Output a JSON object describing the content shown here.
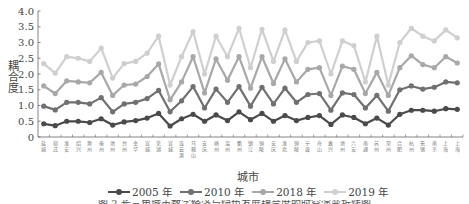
{
  "chart_data": {
    "type": "line",
    "title": "",
    "xlabel": "城市",
    "ylabel": "耦合度",
    "ylim": [
      0,
      4.0
    ],
    "yticks": [
      "0",
      "0.5",
      "1.0",
      "1.5",
      "2.0",
      "2.5",
      "3.0",
      "3.5",
      "4.0"
    ],
    "grid": false,
    "legend_position": "bottom",
    "categories": [
      "盐城",
      "宿迁",
      "淮安",
      "绍兴",
      "滁州",
      "泰州",
      "池州",
      "台州",
      "金华",
      "宣城",
      "芜湖",
      "宣城",
      "连云港",
      "马鞍山",
      "安庆",
      "扬州",
      "温州",
      "衢州",
      "镇江",
      "铜陵",
      "安庆",
      "淮北",
      "铜陵",
      "宁波",
      "舟山",
      "嘉兴",
      "池州",
      "六安",
      "南通",
      "苏州",
      "常州",
      "合肥",
      "杭州",
      "无锡",
      "南京",
      "上海",
      "上海"
    ],
    "series": [
      {
        "name": "2005 年",
        "color": "#4a4a4a",
        "values": [
          0.42,
          0.36,
          0.5,
          0.5,
          0.46,
          0.58,
          0.38,
          0.48,
          0.52,
          0.6,
          0.75,
          0.35,
          0.58,
          0.72,
          0.5,
          0.7,
          0.52,
          0.8,
          0.55,
          0.75,
          0.5,
          0.68,
          0.52,
          0.62,
          0.68,
          0.4,
          0.7,
          0.62,
          0.42,
          0.6,
          0.38,
          0.72,
          0.85,
          0.85,
          0.82,
          0.9,
          0.88
        ]
      },
      {
        "name": "2010 年",
        "color": "#707070",
        "values": [
          0.98,
          0.86,
          1.1,
          1.1,
          1.05,
          1.25,
          0.8,
          1.05,
          1.1,
          1.22,
          1.48,
          0.8,
          1.15,
          1.6,
          0.92,
          1.52,
          1.1,
          1.6,
          0.98,
          1.58,
          1.05,
          1.55,
          1.1,
          1.35,
          1.38,
          0.85,
          1.4,
          1.35,
          0.92,
          1.32,
          0.82,
          1.5,
          1.62,
          1.52,
          1.58,
          1.75,
          1.72
        ]
      },
      {
        "name": "2018 年",
        "color": "#a8a8a8",
        "values": [
          1.62,
          1.38,
          1.78,
          1.75,
          1.72,
          2.05,
          1.32,
          1.65,
          1.68,
          1.92,
          2.32,
          1.18,
          1.75,
          2.55,
          1.4,
          2.48,
          1.8,
          2.55,
          1.55,
          2.55,
          1.7,
          2.48,
          1.75,
          2.15,
          2.2,
          1.32,
          2.25,
          2.15,
          1.38,
          2.05,
          1.32,
          2.2,
          2.58,
          2.3,
          2.2,
          2.55,
          2.35
        ]
      },
      {
        "name": "2019 年",
        "color": "#cfcfcf",
        "values": [
          2.33,
          2.03,
          2.55,
          2.5,
          2.4,
          2.82,
          1.87,
          2.33,
          2.4,
          2.66,
          3.2,
          1.65,
          2.55,
          3.35,
          2.0,
          3.2,
          2.55,
          3.45,
          2.2,
          3.42,
          2.4,
          3.4,
          2.4,
          3.0,
          3.05,
          2.0,
          3.05,
          2.9,
          1.75,
          3.2,
          1.65,
          3.0,
          3.45,
          3.2,
          3.05,
          3.4,
          3.15
        ]
      }
    ]
  },
  "caption": "图 2  长三角城市数字经济与绿色发展耦合度的时空演变折线图"
}
